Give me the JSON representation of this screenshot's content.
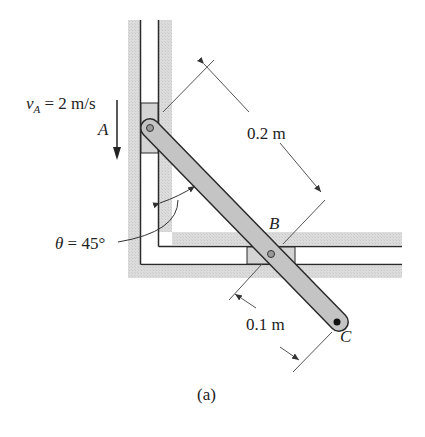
{
  "figure": {
    "caption": "(a)",
    "velocity": {
      "symbol": "v",
      "subscript": "A",
      "equals": "= 2 m/s"
    },
    "angle": {
      "symbol": "θ",
      "equals": "= 45°"
    },
    "points": {
      "A": "A",
      "B": "B",
      "C": "C"
    },
    "dimensions": {
      "AB": "0.2 m",
      "BC": "0.1 m"
    }
  },
  "colors": {
    "track_fill": "#d9d9d9",
    "rod_fill": "#c8c8c8",
    "line": "#2a2a2a",
    "dim_line": "#555555"
  }
}
